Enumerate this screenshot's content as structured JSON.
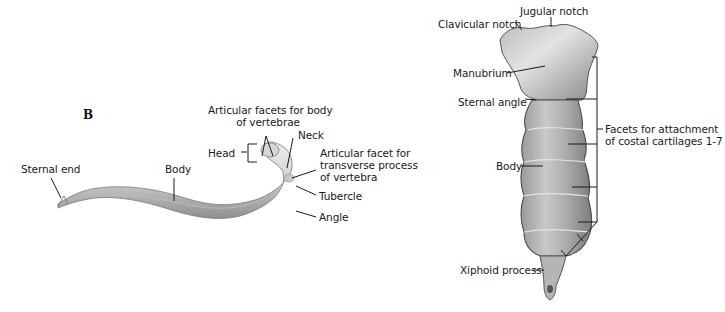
{
  "panel_b": {
    "letter": "B",
    "labels": {
      "facets_body_line1": "Articular facets for body",
      "facets_body_line2": "of vertebrae",
      "neck": "Neck",
      "head": "Head",
      "facet_tp_line1": "Articular facet for",
      "facet_tp_line2": "transverse process",
      "facet_tp_line3": "of vertebra",
      "tubercle": "Tubercle",
      "angle": "Angle",
      "sternal_end": "Sternal end",
      "body": "Body"
    }
  },
  "sternum": {
    "labels": {
      "jugular_notch": "Jugular notch",
      "clavicular_notch": "Clavicular notch",
      "manubrium": "Manubrium",
      "sternal_angle": "Sternal angle",
      "facets_line1": "Facets for attachment",
      "facets_line2": "of costal cartilages 1-7",
      "body": "Body",
      "xiphoid": "Xiphoid process"
    }
  },
  "colors": {
    "bone_light": "#d9d9d9",
    "bone_mid": "#a8a8a8",
    "bone_dark": "#6e6e6e",
    "leader": "#1a1a1a"
  }
}
